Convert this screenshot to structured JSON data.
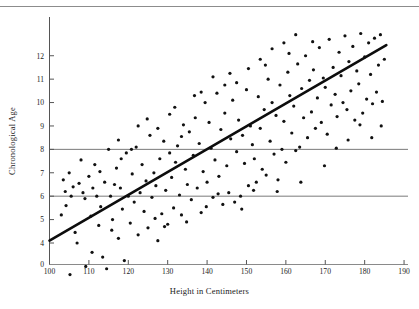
{
  "figure": {
    "title": "",
    "top_rule_color": "#8c8c8c",
    "background": "#ffffff"
  },
  "axis": {
    "x_label": "Height in Centimeters",
    "y_label": "Chronological Age"
  },
  "chart_data": {
    "type": "scatter",
    "title": "",
    "xlabel": "Height in Centimeters",
    "ylabel": "Chronological Age",
    "xlim": [
      100,
      191
    ],
    "ylim": [
      0,
      13.1
    ],
    "y_axis_break": true,
    "y_break_between": [
      0,
      4
    ],
    "grid": false,
    "legend": false,
    "xticks": [
      100,
      110,
      120,
      130,
      140,
      150,
      160,
      170,
      180,
      190
    ],
    "xticklabels": [
      "100",
      "110",
      "120",
      "130",
      "140",
      "150",
      "160",
      "170",
      "180",
      "190"
    ],
    "yticks": [
      0,
      4,
      5,
      6,
      7,
      8,
      9,
      10,
      11,
      12
    ],
    "yticklabels": [
      "0",
      "4",
      "5",
      "6",
      "7",
      "8",
      "9",
      "10",
      "11",
      "12"
    ],
    "marker_color": "#111111",
    "marker_size_px": 3.2,
    "reference_lines": [
      {
        "name": "age-8-line",
        "orientation": "horizontal",
        "y": 8,
        "color": "#6b6b6b",
        "width_px": 0.9
      },
      {
        "name": "age-6-line",
        "orientation": "horizontal",
        "y": 6,
        "color": "#6b6b6b",
        "width_px": 0.9
      }
    ],
    "regression_line": {
      "name": "regression-line",
      "x0": 100,
      "y0": 4.1,
      "x1": 185.5,
      "y1": 12.45,
      "slope": 0.0976,
      "intercept": -5.66,
      "color": "#0d0d0d",
      "width_px": 2.6
    },
    "points": [
      [
        103.5,
        6.7
      ],
      [
        104.0,
        6.2
      ],
      [
        104.2,
        5.6
      ],
      [
        105.0,
        7.0
      ],
      [
        105.2,
        2.65
      ],
      [
        106.0,
        6.4
      ],
      [
        106.5,
        4.45
      ],
      [
        107.5,
        6.55
      ],
      [
        108.0,
        7.55
      ],
      [
        108.5,
        6.15
      ],
      [
        109.0,
        5.9
      ],
      [
        109.2,
        3.0
      ],
      [
        110.0,
        6.85
      ],
      [
        110.5,
        5.15
      ],
      [
        111.0,
        6.35
      ],
      [
        111.5,
        7.35
      ],
      [
        112.0,
        6.0
      ],
      [
        112.5,
        4.75
      ],
      [
        113.0,
        5.55
      ],
      [
        113.5,
        3.4
      ],
      [
        114.0,
        6.6
      ],
      [
        114.5,
        2.9
      ],
      [
        115.0,
        8.0
      ],
      [
        115.5,
        6.0
      ],
      [
        116.0,
        5.0
      ],
      [
        116.5,
        6.5
      ],
      [
        117.0,
        7.2
      ],
      [
        117.5,
        4.2
      ],
      [
        118.0,
        6.35
      ],
      [
        118.5,
        5.45
      ],
      [
        119.0,
        3.25
      ],
      [
        119.5,
        7.85
      ],
      [
        120.0,
        6.0
      ],
      [
        120.5,
        4.85
      ],
      [
        121.0,
        6.95
      ],
      [
        121.5,
        5.75
      ],
      [
        122.0,
        8.1
      ],
      [
        122.5,
        4.35
      ],
      [
        123.0,
        6.15
      ],
      [
        123.5,
        7.35
      ],
      [
        124.0,
        5.35
      ],
      [
        124.5,
        6.65
      ],
      [
        125.0,
        4.65
      ],
      [
        125.5,
        8.6
      ],
      [
        126.0,
        5.95
      ],
      [
        126.5,
        7.0
      ],
      [
        127.0,
        6.45
      ],
      [
        127.5,
        4.1
      ],
      [
        128.0,
        7.6
      ],
      [
        128.5,
        5.25
      ],
      [
        129.0,
        8.35
      ],
      [
        129.5,
        6.25
      ],
      [
        130.0,
        4.8
      ],
      [
        130.5,
        9.5
      ],
      [
        131.0,
        6.8
      ],
      [
        131.5,
        5.5
      ],
      [
        132.0,
        7.45
      ],
      [
        132.5,
        8.15
      ],
      [
        133.0,
        6.05
      ],
      [
        133.5,
        5.2
      ],
      [
        134.0,
        9.05
      ],
      [
        134.5,
        7.15
      ],
      [
        135.0,
        6.5
      ],
      [
        135.5,
        8.75
      ],
      [
        136.0,
        5.85
      ],
      [
        136.5,
        7.75
      ],
      [
        137.0,
        9.35
      ],
      [
        137.5,
        6.35
      ],
      [
        138.0,
        8.25
      ],
      [
        138.5,
        5.3
      ],
      [
        139.0,
        7.05
      ],
      [
        139.5,
        10.0
      ],
      [
        140.0,
        6.6
      ],
      [
        140.5,
        9.15
      ],
      [
        141.0,
        8.05
      ],
      [
        141.5,
        5.95
      ],
      [
        142.0,
        7.55
      ],
      [
        142.5,
        10.4
      ],
      [
        143.0,
        6.85
      ],
      [
        143.5,
        8.85
      ],
      [
        144.0,
        5.65
      ],
      [
        144.5,
        9.55
      ],
      [
        145.0,
        7.3
      ],
      [
        145.5,
        6.15
      ],
      [
        146.0,
        8.45
      ],
      [
        146.5,
        10.1
      ],
      [
        147.0,
        5.75
      ],
      [
        147.5,
        7.9
      ],
      [
        148.0,
        9.25
      ],
      [
        148.5,
        6.0
      ],
      [
        149.0,
        8.6
      ],
      [
        149.5,
        7.4
      ],
      [
        150.0,
        10.55
      ],
      [
        150.5,
        6.45
      ],
      [
        151.0,
        9.0
      ],
      [
        151.5,
        8.2
      ],
      [
        152.0,
        7.6
      ],
      [
        152.5,
        6.6
      ],
      [
        153.0,
        10.25
      ],
      [
        153.5,
        8.9
      ],
      [
        154.0,
        7.15
      ],
      [
        154.5,
        9.7
      ],
      [
        155.0,
        6.9
      ],
      [
        155.5,
        11.0
      ],
      [
        156.0,
        8.35
      ],
      [
        156.5,
        10.0
      ],
      [
        157.0,
        7.8
      ],
      [
        157.5,
        9.45
      ],
      [
        158.0,
        6.7
      ],
      [
        158.5,
        10.75
      ],
      [
        159.0,
        8.0
      ],
      [
        159.5,
        9.2
      ],
      [
        160.0,
        7.45
      ],
      [
        160.5,
        11.3
      ],
      [
        161.0,
        10.3
      ],
      [
        161.5,
        8.7
      ],
      [
        162.0,
        9.85
      ],
      [
        162.5,
        7.95
      ],
      [
        163.0,
        11.65
      ],
      [
        163.5,
        8.1
      ],
      [
        164.0,
        10.6
      ],
      [
        164.5,
        9.35
      ],
      [
        165.0,
        12.0
      ],
      [
        165.5,
        8.5
      ],
      [
        166.0,
        10.95
      ],
      [
        166.5,
        9.6
      ],
      [
        167.0,
        11.4
      ],
      [
        167.5,
        8.9
      ],
      [
        168.0,
        10.2
      ],
      [
        168.5,
        12.35
      ],
      [
        169.0,
        9.15
      ],
      [
        169.5,
        11.05
      ],
      [
        170.0,
        10.65
      ],
      [
        170.5,
        8.65
      ],
      [
        171.0,
        12.7
      ],
      [
        171.5,
        9.9
      ],
      [
        172.0,
        11.5
      ],
      [
        172.5,
        10.35
      ],
      [
        173.0,
        9.4
      ],
      [
        173.5,
        12.15
      ],
      [
        174.0,
        11.15
      ],
      [
        174.5,
        10.0
      ],
      [
        175.0,
        12.85
      ],
      [
        175.5,
        9.7
      ],
      [
        176.0,
        11.75
      ],
      [
        176.5,
        10.5
      ],
      [
        177.0,
        12.4
      ],
      [
        177.5,
        9.25
      ],
      [
        178.0,
        11.35
      ],
      [
        178.5,
        10.8
      ],
      [
        179.0,
        12.95
      ],
      [
        179.5,
        9.55
      ],
      [
        180.0,
        11.95
      ],
      [
        180.5,
        10.15
      ],
      [
        181.0,
        12.55
      ],
      [
        181.5,
        11.2
      ],
      [
        182.0,
        9.95
      ],
      [
        182.5,
        12.75
      ],
      [
        183.0,
        10.45
      ],
      [
        183.5,
        11.6
      ],
      [
        184.0,
        12.9
      ],
      [
        184.5,
        10.05
      ],
      [
        185.0,
        11.85
      ],
      [
        103.0,
        5.2
      ],
      [
        105.5,
        6.0
      ],
      [
        107.0,
        4.0
      ],
      [
        110.8,
        3.6
      ],
      [
        112.8,
        7.05
      ],
      [
        115.8,
        4.55
      ],
      [
        118.2,
        7.6
      ],
      [
        120.8,
        8.0
      ],
      [
        124.8,
        9.3
      ],
      [
        126.8,
        5.05
      ],
      [
        129.2,
        4.7
      ],
      [
        131.8,
        9.8
      ],
      [
        134.8,
        4.9
      ],
      [
        136.8,
        10.3
      ],
      [
        139.8,
        5.55
      ],
      [
        142.8,
        6.1
      ],
      [
        145.8,
        11.25
      ],
      [
        148.8,
        5.45
      ],
      [
        151.8,
        6.25
      ],
      [
        154.8,
        11.6
      ],
      [
        157.8,
        6.2
      ],
      [
        160.8,
        12.1
      ],
      [
        163.8,
        6.6
      ],
      [
        166.8,
        12.6
      ],
      [
        169.8,
        7.3
      ],
      [
        172.8,
        8.05
      ],
      [
        175.8,
        8.4
      ],
      [
        178.8,
        9.05
      ],
      [
        181.8,
        8.5
      ],
      [
        184.2,
        9.0
      ],
      [
        156.5,
        12.3
      ],
      [
        159.5,
        12.55
      ],
      [
        162.5,
        12.9
      ],
      [
        153.5,
        11.85
      ],
      [
        150.5,
        11.45
      ],
      [
        147.5,
        10.85
      ],
      [
        144.5,
        10.75
      ],
      [
        141.5,
        11.1
      ],
      [
        138.5,
        10.45
      ],
      [
        133.5,
        8.55
      ],
      [
        130.5,
        7.85
      ],
      [
        127.5,
        8.9
      ],
      [
        122.5,
        9.0
      ],
      [
        117.5,
        8.4
      ]
    ]
  }
}
